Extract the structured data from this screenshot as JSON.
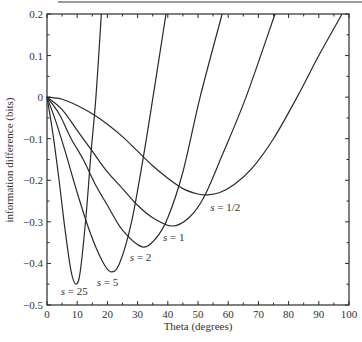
{
  "chart_data": {
    "type": "line",
    "title": "",
    "xlabel": "Theta (degrees)",
    "ylabel": "information difference (bits)",
    "xlim": [
      0,
      100
    ],
    "ylim": [
      -0.5,
      0.2
    ],
    "grid": false,
    "legend": "none (inline curve labels)",
    "x_ticks": [
      0,
      10,
      20,
      30,
      40,
      50,
      60,
      70,
      80,
      90,
      100
    ],
    "x_tick_labels": [
      "0",
      "10",
      "20",
      "30",
      "40",
      "50",
      "60",
      "70",
      "80",
      "90",
      "100"
    ],
    "y_ticks": [
      0.2,
      0.1,
      0,
      -0.1,
      -0.2,
      -0.3,
      -0.4,
      -0.5
    ],
    "y_tick_labels": [
      "0.2",
      "0.1",
      "0",
      "−0.1",
      "−0.2",
      "−0.3",
      "−0.4",
      "−0.5"
    ],
    "series": [
      {
        "name": "s = 25",
        "label_pos": [
          9,
          -0.475
        ],
        "x": [
          0,
          2,
          4,
          6,
          8,
          9.6,
          11,
          13,
          14.5,
          16.2,
          18
        ],
        "values": [
          0,
          -0.09,
          -0.2,
          -0.32,
          -0.42,
          -0.45,
          -0.42,
          -0.28,
          -0.14,
          0,
          0.2
        ]
      },
      {
        "name": "s = 5",
        "label_pos": [
          20,
          -0.455
        ],
        "x": [
          0,
          3,
          6,
          10,
          14,
          18,
          21,
          24,
          28,
          32,
          35.1,
          39.4
        ],
        "values": [
          0,
          -0.06,
          -0.13,
          -0.23,
          -0.32,
          -0.39,
          -0.42,
          -0.4,
          -0.3,
          -0.14,
          0,
          0.2
        ]
      },
      {
        "name": "s = 2",
        "label_pos": [
          31,
          -0.395
        ],
        "x": [
          0,
          4,
          8,
          12,
          16,
          20,
          25,
          31.5,
          36,
          40,
          45,
          50.7,
          58
        ],
        "values": [
          0,
          -0.04,
          -0.1,
          -0.15,
          -0.21,
          -0.26,
          -0.32,
          -0.36,
          -0.34,
          -0.29,
          -0.18,
          0,
          0.2
        ]
      },
      {
        "name": "s = 1",
        "label_pos": [
          42,
          -0.345
        ],
        "x": [
          0,
          5,
          10,
          15,
          20,
          25,
          30,
          35,
          41.4,
          47,
          52,
          58,
          65.9,
          75.5
        ],
        "values": [
          0,
          -0.03,
          -0.08,
          -0.13,
          -0.18,
          -0.22,
          -0.26,
          -0.29,
          -0.31,
          -0.29,
          -0.24,
          -0.14,
          0,
          0.2
        ]
      },
      {
        "name": "s = 1/2",
        "label_pos": [
          59,
          -0.275
        ],
        "x": [
          0,
          5,
          10,
          15,
          20,
          25,
          30,
          35,
          40,
          45,
          50,
          53,
          57,
          62,
          68,
          75,
          82.8,
          90,
          97.7
        ],
        "values": [
          0,
          -0.005,
          -0.02,
          -0.04,
          -0.065,
          -0.095,
          -0.13,
          -0.165,
          -0.195,
          -0.22,
          -0.233,
          -0.235,
          -0.23,
          -0.21,
          -0.17,
          -0.1,
          0,
          0.1,
          0.2
        ]
      }
    ]
  },
  "axes": {
    "xlabel": "Theta (degrees)",
    "ylabel": "information difference (bits)"
  },
  "colors": {
    "line": "#2a2a2a",
    "axis": "#2a2a2a",
    "text": "#333333",
    "background": "#ffffff"
  }
}
